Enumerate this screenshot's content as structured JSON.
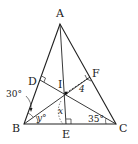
{
  "diagram": {
    "type": "geometry",
    "points": {
      "A": {
        "label": "A",
        "x": 60,
        "y": 24
      },
      "B": {
        "label": "B",
        "x": 24,
        "y": 124
      },
      "C": {
        "label": "C",
        "x": 116,
        "y": 124
      },
      "I": {
        "label": "I",
        "x": 66,
        "y": 93
      },
      "D": {
        "label": "D",
        "x": 40,
        "y": 80
      },
      "E": {
        "label": "E",
        "x": 66,
        "y": 124
      },
      "F": {
        "label": "F",
        "x": 90,
        "y": 77
      }
    },
    "annotations": {
      "angle_ABI": "30°",
      "angle_IBC": "y°",
      "angle_BIE": "x",
      "angle_ICB": "35°",
      "segment_IF": "4"
    },
    "colors": {
      "stroke": "#222222",
      "background": "#ffffff"
    }
  }
}
